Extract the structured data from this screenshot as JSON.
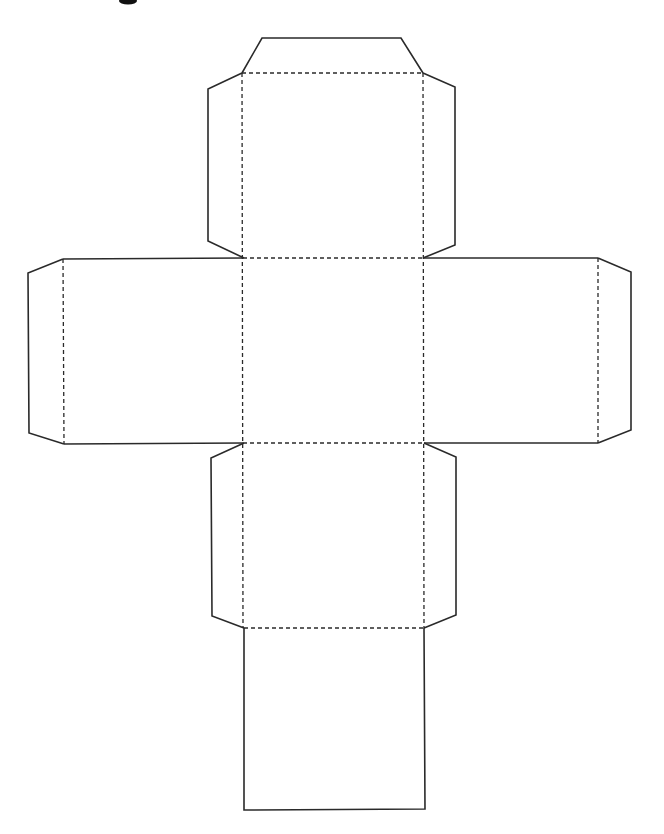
{
  "diagram": {
    "type": "cube-net",
    "colors": {
      "background": "#ffffff",
      "line": "#2a2a2a"
    },
    "legend": {
      "solid_line": "cut line",
      "dashed_line": "fold line"
    },
    "faces": [
      {
        "name": "top-face",
        "x": 243,
        "y": 73,
        "w": 181,
        "h": 185
      },
      {
        "name": "center-face",
        "x": 243,
        "y": 258,
        "w": 181,
        "h": 185
      },
      {
        "name": "left-face",
        "x": 63,
        "y": 258,
        "w": 180,
        "h": 185
      },
      {
        "name": "right-face",
        "x": 424,
        "y": 258,
        "w": 174,
        "h": 185
      },
      {
        "name": "lower-face",
        "x": 243,
        "y": 443,
        "w": 181,
        "h": 185
      },
      {
        "name": "bottom-face",
        "x": 243,
        "y": 628,
        "w": 181,
        "h": 182
      }
    ],
    "flaps": [
      {
        "name": "top-flap",
        "points": "242,73 262,38 401,38 423,73"
      },
      {
        "name": "top-left-flap",
        "points": "242,73 208,89 208,241 244,258"
      },
      {
        "name": "top-right-flap",
        "points": "423,73 455,87 455,245 423,258"
      },
      {
        "name": "left-flap",
        "points": "63,259 28,273 29,433 64,444"
      },
      {
        "name": "right-flap",
        "points": "598,258 631,272 631,430 598,443"
      },
      {
        "name": "lower-left-flap",
        "points": "244,443 211,458 212,616 244,628"
      },
      {
        "name": "lower-right-flap",
        "points": "424,443 456,457 456,615 424,628"
      }
    ],
    "cut_outline": {
      "segments": [
        "63,259 243,258",
        "424,258 598,258",
        "64,444 243,443",
        "424,443 598,443",
        "244,628 244,810 425,809 424,628"
      ]
    },
    "fold_lines": [
      "242,73 423,73",
      "242,73 243,628",
      "423,73 424,628",
      "243,258 424,258",
      "243,443 424,443",
      "244,628 424,628",
      "63,259 64,444",
      "598,258 598,443"
    ],
    "cropped_title_glyph": {
      "x": 118,
      "y": 0,
      "w": 20,
      "h": 5
    }
  }
}
